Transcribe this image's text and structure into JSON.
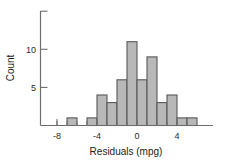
{
  "chart_data": {
    "type": "bar",
    "title": "",
    "subtitle": "",
    "xlabel": "Residuals (mpg)",
    "ylabel": "Count",
    "xlim": [
      -9,
      6.5
    ],
    "ylim": [
      0,
      16
    ],
    "grid": false,
    "legend": null,
    "bin_width": 1,
    "x_major_ticks": [
      -8,
      -4,
      0,
      4
    ],
    "x_major_tick_labels": [
      "-8",
      "-4",
      "0",
      "4"
    ],
    "x_minor_ticks": [
      -8,
      -7,
      -6,
      -5,
      -4,
      -3,
      -2,
      -1,
      0,
      1,
      2,
      3,
      4,
      5
    ],
    "y_major_ticks": [
      5,
      10,
      15
    ],
    "y_major_tick_labels": [
      "5",
      "10",
      ""
    ],
    "bins": [
      {
        "left": -7,
        "right": -6,
        "count": 1
      },
      {
        "left": -5,
        "right": -4,
        "count": 1
      },
      {
        "left": -4,
        "right": -3,
        "count": 4
      },
      {
        "left": -3,
        "right": -2,
        "count": 3
      },
      {
        "left": -2,
        "right": -1,
        "count": 6
      },
      {
        "left": -1,
        "right": 0,
        "count": 11
      },
      {
        "left": 0,
        "right": 1,
        "count": 6
      },
      {
        "left": 1,
        "right": 2,
        "count": 9
      },
      {
        "left": 2,
        "right": 3,
        "count": 3
      },
      {
        "left": 3,
        "right": 4,
        "count": 4
      },
      {
        "left": 4,
        "right": 5,
        "count": 1
      },
      {
        "left": 5,
        "right": 6,
        "count": 1
      }
    ],
    "categories": [
      "-7",
      "-5",
      "-4",
      "-3",
      "-2",
      "-1",
      "0",
      "1",
      "2",
      "3",
      "4",
      "5"
    ],
    "values": [
      1,
      1,
      4,
      3,
      6,
      11,
      6,
      9,
      3,
      4,
      1,
      1
    ],
    "colors": {
      "bar_fill": "#b8b8b8",
      "bar_stroke": "#585858",
      "axis": "#6e6e6e",
      "text": "#1c1c1c",
      "background": "#ffffff"
    }
  },
  "axis": {
    "x_label": "Residuals (mpg)",
    "y_label": "Count",
    "x_tick_labels": [
      "-8",
      "-4",
      "0",
      "4"
    ],
    "y_tick_labels": [
      "5",
      "10"
    ]
  }
}
